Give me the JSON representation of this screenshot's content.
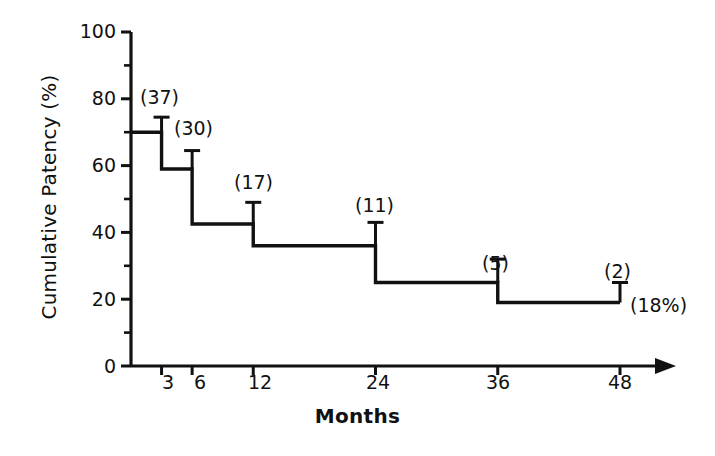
{
  "chart_data": {
    "type": "line",
    "subtype": "kaplan-meier-step",
    "title": "",
    "xlabel": "Months",
    "ylabel": "Cumulative Patency (%)",
    "xlim": [
      0,
      52
    ],
    "ylim": [
      0,
      100
    ],
    "grid": false,
    "legend": null,
    "x_ticks": [
      3,
      6,
      12,
      24,
      36,
      48
    ],
    "x_tick_labels": [
      "3",
      "6",
      "12",
      "24",
      "36",
      "48"
    ],
    "y_ticks": [
      0,
      20,
      40,
      60,
      80,
      100
    ],
    "y_tick_labels": [
      "0",
      "20",
      "40",
      "60",
      "80",
      "100"
    ],
    "y_minor_ticks": [
      10,
      30,
      50,
      70,
      90
    ],
    "x_axis_arrow": true,
    "steps": [
      {
        "x_start": 0,
        "x_end": 3,
        "value": 70
      },
      {
        "x_start": 3,
        "x_end": 6,
        "value": 59
      },
      {
        "x_start": 6,
        "x_end": 12,
        "value": 42.5
      },
      {
        "x_start": 12,
        "x_end": 24,
        "value": 36
      },
      {
        "x_start": 24,
        "x_end": 36,
        "value": 25
      },
      {
        "x_start": 36,
        "x_end": 48,
        "value": 19
      }
    ],
    "error_bars": [
      {
        "x": 3,
        "value": 70,
        "upper": 74.5,
        "label": "(37)"
      },
      {
        "x": 6,
        "value": 59,
        "upper": 64.5,
        "label": "(30)"
      },
      {
        "x": 12,
        "value": 42.5,
        "upper": 49.0,
        "label": "(17)"
      },
      {
        "x": 24,
        "value": 36,
        "upper": 43.0,
        "label": "(11)"
      },
      {
        "x": 36,
        "value": 25,
        "upper": 32.0,
        "label": "(5)"
      },
      {
        "x": 48,
        "value": 19,
        "upper": 25.0,
        "label": "(2)"
      }
    ],
    "annotations": [
      {
        "text": "(18%)",
        "x": 48,
        "value": 19,
        "position": "right-of-endpoint"
      }
    ],
    "series": [
      {
        "name": "Cumulative Patency",
        "x": [
          0,
          3,
          6,
          12,
          24,
          36,
          48
        ],
        "values": [
          70,
          70,
          59,
          42.5,
          36,
          25,
          19
        ],
        "at_risk": [
          null,
          37,
          30,
          17,
          11,
          5,
          2
        ]
      }
    ]
  },
  "axes": {
    "y_label": "Cumulative Patency (%)",
    "x_label": "Months",
    "y_tick_labels": [
      "100",
      "80",
      "60",
      "40",
      "20",
      "0"
    ],
    "x_tick_labels": [
      "3",
      "6",
      "12",
      "24",
      "36",
      "48"
    ]
  },
  "risk_labels": {
    "n3": "(37)",
    "n6": "(30)",
    "n12": "(17)",
    "n24": "(11)",
    "n36": "(5)",
    "n48": "(2)",
    "final_percent": "(18%)"
  },
  "colors": {
    "line": "#111111",
    "axis": "#111111",
    "text": "#111111",
    "background": "#ffffff"
  }
}
